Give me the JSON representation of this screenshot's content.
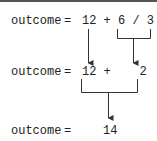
{
  "rows": [
    {
      "lhs": "outcome",
      "eq": "=",
      "expr": "12 + 6 / 3"
    },
    {
      "lhs": "outcome",
      "eq": "=",
      "expr": "12 +    2"
    },
    {
      "lhs": "outcome",
      "eq": "=",
      "expr": "14"
    }
  ],
  "colors": {
    "text": "#222222",
    "line": "#333333",
    "border": "#555555"
  }
}
